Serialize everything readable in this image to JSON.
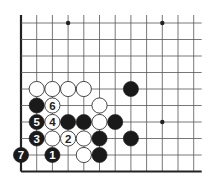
{
  "diagram": {
    "type": "go-board-fragment",
    "grid": {
      "columns": 12,
      "rows": 10,
      "origin_x": 21,
      "origin_y": 23,
      "step_x": 15.7,
      "step_y": 16.5,
      "left_edge": true,
      "bottom_edge": true,
      "top_open": true,
      "right_open": true
    },
    "colors": {
      "line": "#555555",
      "edge": "#222222",
      "black_stone": "#1a1a1a",
      "white_stone": "#ffffff",
      "white_outline": "#333333",
      "black_label": "#ffffff",
      "white_label": "#222222"
    },
    "star_points": [
      {
        "col": 3,
        "row": 0
      },
      {
        "col": 9,
        "row": 0
      },
      {
        "col": 9,
        "row": 6
      }
    ],
    "stones": [
      {
        "color": "white",
        "col": 1,
        "row": 4,
        "label": ""
      },
      {
        "color": "white",
        "col": 2,
        "row": 4,
        "label": ""
      },
      {
        "color": "white",
        "col": 3,
        "row": 4,
        "label": ""
      },
      {
        "color": "white",
        "col": 4,
        "row": 4,
        "label": ""
      },
      {
        "color": "black",
        "col": 7,
        "row": 4,
        "label": ""
      },
      {
        "color": "black",
        "col": 1,
        "row": 5,
        "label": ""
      },
      {
        "color": "white",
        "col": 2,
        "row": 5,
        "label": "6"
      },
      {
        "color": "white",
        "col": 5,
        "row": 5,
        "label": ""
      },
      {
        "color": "black",
        "col": 1,
        "row": 6,
        "label": "5"
      },
      {
        "color": "white",
        "col": 2,
        "row": 6,
        "label": "4"
      },
      {
        "color": "black",
        "col": 3,
        "row": 6,
        "label": ""
      },
      {
        "color": "black",
        "col": 4,
        "row": 6,
        "label": ""
      },
      {
        "color": "white",
        "col": 5,
        "row": 6,
        "label": ""
      },
      {
        "color": "black",
        "col": 6,
        "row": 6,
        "label": ""
      },
      {
        "color": "black",
        "col": 1,
        "row": 7,
        "label": "3"
      },
      {
        "color": "white",
        "col": 2,
        "row": 7,
        "label": ""
      },
      {
        "color": "white",
        "col": 3,
        "row": 7,
        "label": "2"
      },
      {
        "color": "white",
        "col": 4,
        "row": 7,
        "label": ""
      },
      {
        "color": "black",
        "col": 5,
        "row": 7,
        "label": ""
      },
      {
        "color": "black",
        "col": 7,
        "row": 7,
        "label": ""
      },
      {
        "color": "black",
        "col": 0,
        "row": 8,
        "label": "7"
      },
      {
        "color": "black",
        "col": 2,
        "row": 8,
        "label": "1"
      },
      {
        "color": "white",
        "col": 4,
        "row": 8,
        "label": ""
      },
      {
        "color": "black",
        "col": 5,
        "row": 8,
        "label": ""
      }
    ]
  }
}
